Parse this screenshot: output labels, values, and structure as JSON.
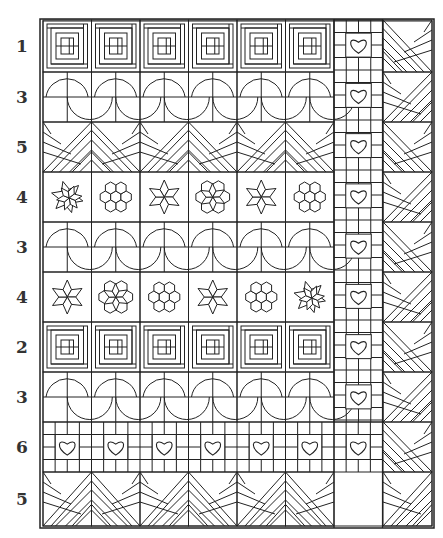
{
  "figure": {
    "type": "quilt-layout-diagram",
    "frame": {
      "x": 40,
      "y": 19,
      "width": 394,
      "height": 509
    },
    "line_color": "#222222",
    "label_color": "#333333"
  },
  "rows": [
    {
      "label": "1",
      "block": "log-cabin",
      "y": 20,
      "h": 52
    },
    {
      "label": "3",
      "block": "drunkards-path",
      "y": 72,
      "h": 50
    },
    {
      "label": "5",
      "block": "diagonal-strips",
      "y": 122,
      "h": 50
    },
    {
      "label": "4",
      "block": "stars-and-hexagons",
      "y": 172,
      "h": 50,
      "sequence": [
        "pinwheel-star",
        "hexagon-flower",
        "star",
        "pinwheel-hexagon",
        "star",
        "hexagon-flower"
      ]
    },
    {
      "label": "3",
      "block": "drunkards-path",
      "y": 222,
      "h": 50
    },
    {
      "label": "4",
      "block": "stars-and-hexagons",
      "y": 272,
      "h": 50,
      "sequence": [
        "star",
        "pinwheel-hexagon",
        "hexagon-flower",
        "star",
        "hexagon-flower",
        "pinwheel-star"
      ]
    },
    {
      "label": "2",
      "block": "log-cabin",
      "y": 322,
      "h": 50
    },
    {
      "label": "3",
      "block": "drunkards-path",
      "y": 372,
      "h": 50
    },
    {
      "label": "6",
      "block": "heart-grid",
      "y": 422,
      "h": 50
    },
    {
      "label": "5",
      "block": "diagonal-strips",
      "y": 472,
      "h": 54
    }
  ],
  "columns": {
    "x0": 43,
    "width": 48.5,
    "count": 6
  },
  "side_columns": [
    {
      "name": "heart-column",
      "x": 334,
      "w": 49,
      "block": "heart-grid",
      "hearts": 7
    },
    {
      "name": "diagonal-column",
      "x": 383,
      "w": 49,
      "block": "diagonal-strips"
    }
  ]
}
